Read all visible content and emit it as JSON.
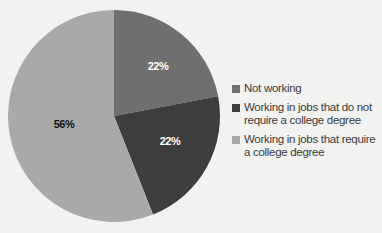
{
  "chart_data": {
    "type": "pie",
    "title": "",
    "categories": [
      "Not working",
      "Working in jobs that do not require a college degree",
      "Working in jobs that require a college degree"
    ],
    "values": [
      22,
      22,
      56
    ],
    "labels": [
      "22%",
      "22%",
      "56%"
    ],
    "colors": [
      "#6f6f6f",
      "#3d3d3d",
      "#a9a9a9"
    ],
    "legend_position": "right",
    "start_angle_deg": 0,
    "direction": "clockwise"
  },
  "legend": {
    "items": [
      {
        "label": "Not working",
        "color": "#6f6f6f"
      },
      {
        "label": "Working in jobs that do not require a college degree",
        "color": "#3d3d3d"
      },
      {
        "label": "Working in jobs that require a college degree",
        "color": "#a9a9a9"
      }
    ]
  }
}
